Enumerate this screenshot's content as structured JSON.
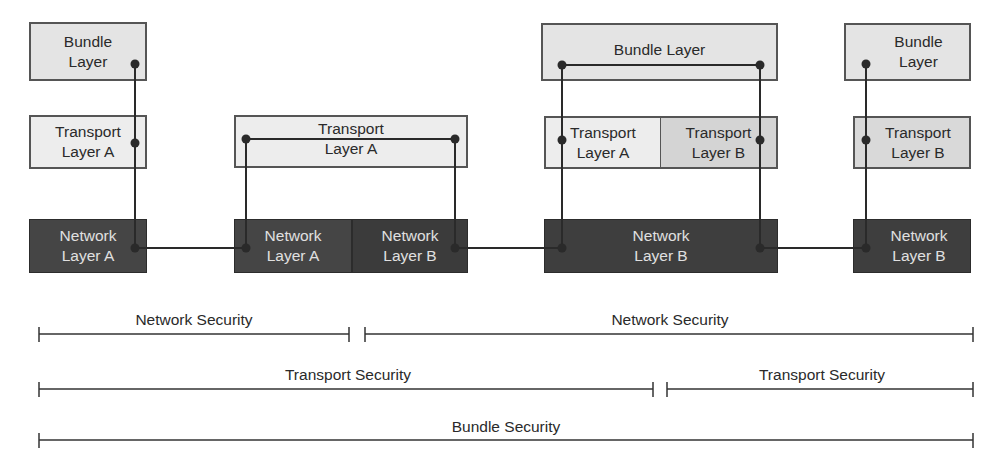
{
  "diagram": {
    "title": "",
    "colors": {
      "bundle_fill": "#e4e4e4",
      "transport_a_fill": "#ededed",
      "transport_b_fill": "#d4d4d4",
      "network_fill": "#454545",
      "line": "#2a2a2a"
    },
    "nodes": {
      "n1": {
        "bundle": "Bundle\nLayer",
        "transport": "Transport\nLayer A",
        "network": "Network\nLayer A"
      },
      "n2": {
        "transport": "Transport\nLayer A",
        "network_a": "Network\nLayer A",
        "network_b": "Network\nLayer B"
      },
      "n3": {
        "bundle": "Bundle Layer",
        "transport_a": "Transport\nLayer A",
        "transport_b": "Transport\nLayer B",
        "network": "Network\nLayer B"
      },
      "n4": {
        "bundle": "Bundle\nLayer",
        "transport": "Transport\nLayer B",
        "network": "Network\nLayer B"
      }
    },
    "spans": {
      "network_security_1": "Network Security",
      "network_security_2": "Network Security",
      "transport_security_1": "Transport Security",
      "transport_security_2": "Transport Security",
      "bundle_security": "Bundle Security"
    }
  }
}
